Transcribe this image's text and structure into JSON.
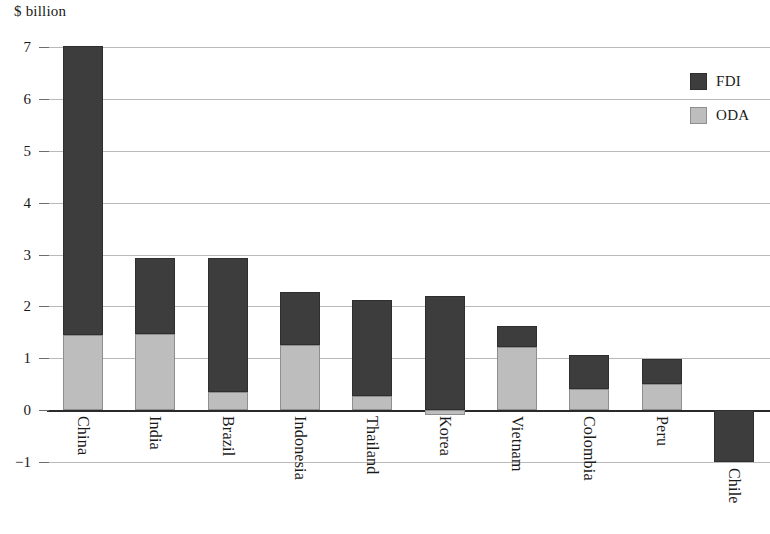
{
  "chart_data": {
    "type": "bar",
    "stacked": true,
    "title": "",
    "subtitle": "",
    "xlabel": "",
    "ylabel": "$ billion",
    "ylim": [
      -2,
      7
    ],
    "yticks": [
      7,
      6,
      5,
      4,
      3,
      2,
      1,
      0,
      -1
    ],
    "ytick_labels": [
      "7",
      "6",
      "5",
      "4",
      "3",
      "2",
      "1",
      "0",
      "−1"
    ],
    "grid": true,
    "legend_position": "top-right",
    "categories": [
      "China",
      "India",
      "Brazil",
      "Indonesia",
      "Thailand",
      "Korea",
      "Vietnam",
      "Colombia",
      "Peru",
      "Chile"
    ],
    "series": [
      {
        "name": "ODA",
        "color": "#bdbdbd",
        "values": [
          1.45,
          1.47,
          0.35,
          1.25,
          0.27,
          -0.1,
          1.22,
          0.4,
          0.5,
          0.0
        ]
      },
      {
        "name": "FDI",
        "color": "#3d3d3d",
        "values": [
          5.57,
          1.46,
          2.58,
          1.02,
          1.85,
          2.2,
          0.41,
          0.66,
          0.48,
          -1.0
        ]
      }
    ],
    "totals": [
      7.02,
      2.93,
      2.93,
      2.27,
      2.12,
      2.2,
      1.63,
      1.06,
      0.98,
      -1.0
    ]
  },
  "axis": {
    "y_title": "$ billion"
  },
  "legend": {
    "items": [
      {
        "label": "FDI",
        "color": "#3d3d3d",
        "swatch": "fdi"
      },
      {
        "label": "ODA",
        "color": "#bdbdbd",
        "swatch": "oda"
      }
    ]
  },
  "colors": {
    "fdi": "#3d3d3d",
    "oda": "#bdbdbd",
    "grid": "#b9b9b9",
    "zero_axis": "#2a2a2a",
    "background": "#ffffff",
    "text": "#1a1a1a"
  }
}
